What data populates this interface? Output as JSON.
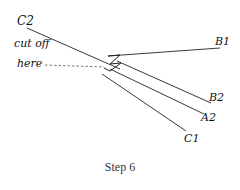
{
  "diagram": {
    "labels": {
      "c2": "C2",
      "cut_off_line1": "cut off",
      "cut_off_line2": "here",
      "b1": "B1",
      "b2": "B2",
      "a2": "A2",
      "c1": "C1"
    },
    "caption": "Step 6",
    "colors": {
      "line": "#222222",
      "dashed": "#555555",
      "background": "#ffffff"
    }
  }
}
